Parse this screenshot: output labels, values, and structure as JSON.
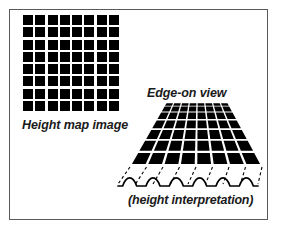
{
  "figure": {
    "background_color": "#ffffff",
    "frame_color": "#5a5a5a",
    "ink_color": "#000000"
  },
  "labels": {
    "height_map": "Height map image",
    "edge_on": "Edge-on view",
    "interpretation": "(height interpretation)"
  },
  "height_map_grid": {
    "columns": 8,
    "rows": 8,
    "cell_fill": "#000000",
    "gap_color": "#ffffff",
    "bounds": {
      "x": 22,
      "y": 14,
      "width": 98,
      "height": 98
    }
  },
  "perspective_grid": {
    "columns": 8,
    "rows": 7,
    "cell_fill": "#000000",
    "bounds": {
      "x": 128,
      "y": 103,
      "width": 136,
      "height": 62
    },
    "top_left_x": 166,
    "top_right_x": 228,
    "bottom_left_x": 130,
    "bottom_right_x": 262
  },
  "projection_lines": {
    "count": 9,
    "style": "dashed",
    "color": "#000000"
  },
  "height_profile": {
    "type": "wave",
    "bumps": 6,
    "color": "#000000",
    "baseline_y": 186,
    "amplitude": 7,
    "x_start": 118,
    "x_end": 258
  }
}
